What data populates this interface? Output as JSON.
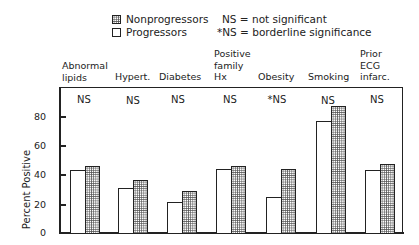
{
  "legend": {
    "items": [
      {
        "label": "Nonprogressors",
        "pattern": "dotted"
      },
      {
        "label": "Progressors",
        "pattern": "white"
      }
    ],
    "notes": [
      "NS = not significant",
      "*NS = borderline significance"
    ]
  },
  "axis": {
    "ylabel": "Percent Positive",
    "ticks": [
      "0",
      "20",
      "40",
      "60",
      "80"
    ]
  },
  "chart_data": {
    "type": "bar",
    "title": "",
    "xlabel": "",
    "ylabel": "Percent Positive",
    "ylim": [
      0,
      100
    ],
    "yticks": [
      0,
      20,
      40,
      60,
      80
    ],
    "grid": false,
    "legend_position": "top",
    "categories": [
      "Abnormal lipids",
      "Hypert.",
      "Diabetes",
      "Positive family Hx",
      "Obesity",
      "Smoking",
      "Prior ECG infarc."
    ],
    "significance": [
      "NS",
      "NS",
      "NS",
      "NS",
      "*NS",
      "NS",
      "NS"
    ],
    "series": [
      {
        "name": "Progressors",
        "pattern": "white",
        "values": [
          43,
          31,
          21,
          44,
          25,
          77,
          43
        ]
      },
      {
        "name": "Nonprogressors",
        "pattern": "dotted",
        "values": [
          46,
          36,
          29,
          46,
          44,
          87,
          47
        ]
      }
    ],
    "annotations": [
      "NS = not significant",
      "*NS = borderline significance"
    ]
  },
  "categories": [
    {
      "label": "Abnormal\nlipids",
      "sig": "NS"
    },
    {
      "label": "Hypert.",
      "sig": "NS"
    },
    {
      "label": "Diabetes",
      "sig": "NS"
    },
    {
      "label": "Positive\nfamily\nHx",
      "sig": "NS"
    },
    {
      "label": "Obesity",
      "sig": "*NS"
    },
    {
      "label": "Smoking",
      "sig": "NS"
    },
    {
      "label": "Prior\nECG\ninfarc.",
      "sig": "NS"
    }
  ]
}
